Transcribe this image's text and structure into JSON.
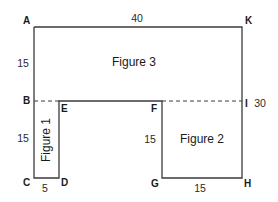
{
  "diagram": {
    "points": {
      "A": "A",
      "K": "K",
      "B": "B",
      "E": "E",
      "F": "F",
      "I": "I",
      "C": "C",
      "D": "D",
      "G": "G",
      "H": "H"
    },
    "dimensions": {
      "top_AK": "40",
      "left_AB": "15",
      "left_BC": "15",
      "bottom_CD": "5",
      "inner_FG": "15",
      "bottom_GH": "15",
      "right_KH": "30"
    },
    "figures": {
      "figure1": "Figure 1",
      "figure2": "Figure 2",
      "figure3": "Figure 3"
    }
  }
}
